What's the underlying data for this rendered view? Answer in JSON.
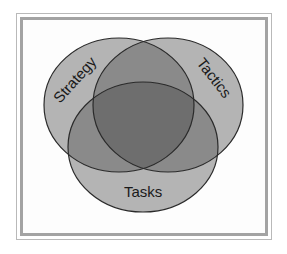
{
  "diagram": {
    "type": "venn",
    "sets": [
      {
        "id": "strategy",
        "label": "Strategy",
        "cx": 119,
        "cy": 105,
        "rx": 75,
        "ry": 67
      },
      {
        "id": "tactics",
        "label": "Tactics",
        "cx": 168,
        "cy": 105,
        "rx": 75,
        "ry": 67
      },
      {
        "id": "tasks",
        "label": "Tasks",
        "cx": 143,
        "cy": 147,
        "rx": 75,
        "ry": 65
      }
    ],
    "colors": {
      "single": "#b4b4b4",
      "pair": "#8a8a8a",
      "center": "#6e6e6e",
      "stroke": "#2a2a2a",
      "frame_outer": "#b9b9b9",
      "frame_inner": "#a3a3a3"
    }
  },
  "labels": {
    "strategy": "Strategy",
    "tactics": "Tactics",
    "tasks": "Tasks"
  }
}
